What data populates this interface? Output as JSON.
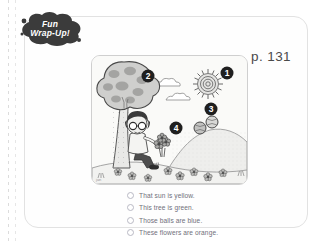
{
  "badge": {
    "line1": "Fun",
    "line2": "Wrap-Up!",
    "shape": "cloud-blob",
    "color": "#3b3b3b"
  },
  "page_label": "p. 131",
  "illustration": {
    "alt": "Boy with glasses sitting under a tree holding flowers, sun and clouds in sky, hill with balls rolling down",
    "markers": [
      {
        "number": "1",
        "target": "sun"
      },
      {
        "number": "2",
        "target": "tree"
      },
      {
        "number": "3",
        "target": "balls"
      },
      {
        "number": "4",
        "target": "flowers"
      }
    ],
    "elements": [
      "sun",
      "cloud",
      "cloud",
      "tree",
      "boy",
      "flowers",
      "hill",
      "balls",
      "grass"
    ],
    "palette": {
      "sky": "#f7f7f5",
      "ink": "#4a4a4a",
      "mid_gray": "#9a9a9a",
      "light_gray": "#d6d6d6",
      "marker": "#2b2b2b"
    }
  },
  "options": [
    {
      "id": "opt-1",
      "text": "That sun is yellow."
    },
    {
      "id": "opt-2",
      "text": "This tree is green."
    },
    {
      "id": "opt-3",
      "text": "Those balls are blue."
    },
    {
      "id": "opt-4",
      "text": "These flowers are orange."
    }
  ]
}
